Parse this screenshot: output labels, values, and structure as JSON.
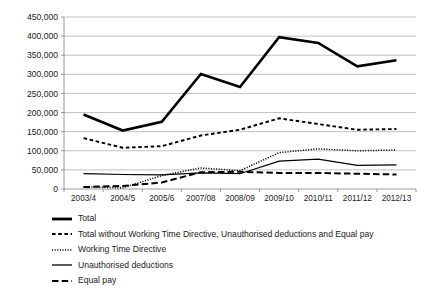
{
  "chart_data": {
    "type": "line",
    "title": "",
    "subtitle": "",
    "xlabel": "",
    "ylabel": "",
    "grid": true,
    "legend_position": "bottom-left",
    "ylim": [
      0,
      450000
    ],
    "ytick_values": [
      0,
      50000,
      100000,
      150000,
      200000,
      250000,
      300000,
      350000,
      400000,
      450000
    ],
    "ytick_labels": [
      "0",
      "50,000",
      "100,000",
      "150,000",
      "200,000",
      "250,000",
      "300,000",
      "350,000",
      "400,000",
      "450,000"
    ],
    "categories": [
      "2003/4",
      "2004/5",
      "2005/6",
      "2007/08",
      "2008/09",
      "2009/10",
      "2010/11",
      "2011/12",
      "2012/13"
    ],
    "series": [
      {
        "name": "Total",
        "style": "solid-thick",
        "values": [
          195000,
          153000,
          176000,
          301000,
          267000,
          397000,
          382000,
          321000,
          337000
        ]
      },
      {
        "name": "Total without Working Time Directive, Unauthorised deductions and Equal pay",
        "style": "short-dash",
        "values": [
          133000,
          108000,
          112000,
          140000,
          155000,
          185000,
          170000,
          155000,
          157000
        ]
      },
      {
        "name": "Working Time Directive",
        "style": "dotted",
        "values": [
          6000,
          3000,
          35000,
          55000,
          48000,
          95000,
          105000,
          100000,
          102000
        ]
      },
      {
        "name": "Unauthorised deductions",
        "style": "solid-thin",
        "values": [
          40000,
          38000,
          37000,
          42000,
          40000,
          73000,
          78000,
          62000,
          63000
        ]
      },
      {
        "name": "Equal pay",
        "style": "long-dash",
        "values": [
          5000,
          8000,
          17000,
          44000,
          45000,
          42000,
          42000,
          40000,
          38000
        ]
      }
    ]
  },
  "colors": {
    "series_line": "#000000",
    "gridline": "#a6a6a6",
    "axis": "#808080",
    "background": "#ffffff",
    "text": "#1a1a1a"
  },
  "legend": {
    "items": [
      {
        "label": "Total",
        "swatch": "solid-thick-swatch"
      },
      {
        "label": "Total without Working Time Directive, Unauthorised deductions and Equal pay",
        "swatch": "short-dash-swatch"
      },
      {
        "label": "Working Time Directive",
        "swatch": "dotted-swatch"
      },
      {
        "label": "Unauthorised deductions",
        "swatch": "solid-thin-swatch"
      },
      {
        "label": "Equal pay",
        "swatch": "long-dash-swatch"
      }
    ]
  }
}
